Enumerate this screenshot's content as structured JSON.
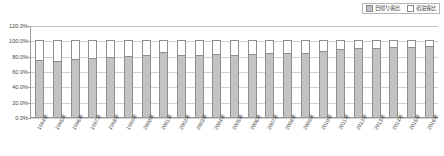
{
  "chart_data": {
    "type": "bar",
    "subtype": "stacked-100-percent-column",
    "title": "",
    "xlabel": "",
    "ylabel": "",
    "ylim": [
      0,
      120
    ],
    "ytick_labels": [
      "120.0%",
      "100.0%",
      "80.0%",
      "60.0%",
      "40.0%",
      "20.0%",
      "0.0%"
    ],
    "ytick_values": [
      120,
      100,
      80,
      60,
      40,
      20,
      0
    ],
    "grid": true,
    "legend_position": "top-right",
    "categories": [
      "1994年",
      "1995年",
      "1996年",
      "1997年",
      "1998年",
      "1999年",
      "2000年",
      "2001年",
      "2002年",
      "2003年",
      "2004年",
      "2005年",
      "2006年",
      "2007年",
      "2008年",
      "2009年",
      "2010年",
      "2011年",
      "2012年",
      "2013年",
      "2014年",
      "2015年",
      "2016年"
    ],
    "series": [
      {
        "name": "日帰り客比",
        "color": "#c3c3c3",
        "values": [
          75.0,
          73.0,
          75.5,
          77.0,
          78.5,
          79.5,
          81.0,
          84.5,
          81.0,
          81.0,
          82.5,
          81.5,
          82.5,
          83.0,
          84.0,
          83.5,
          85.5,
          88.5,
          89.5,
          90.5,
          91.5,
          91.0,
          92.0
        ]
      },
      {
        "name": "宿泊客比",
        "color": "#ffffff",
        "values": [
          25.0,
          27.0,
          24.5,
          23.0,
          21.5,
          20.5,
          19.0,
          15.5,
          19.0,
          19.0,
          17.5,
          18.5,
          17.5,
          17.0,
          16.0,
          16.5,
          14.5,
          11.5,
          10.5,
          9.5,
          8.5,
          9.0,
          8.0
        ]
      }
    ]
  },
  "legend": {
    "items": [
      {
        "label": "日帰り客比",
        "swatch": "day"
      },
      {
        "label": "宿泊客比",
        "swatch": "stay"
      }
    ]
  }
}
